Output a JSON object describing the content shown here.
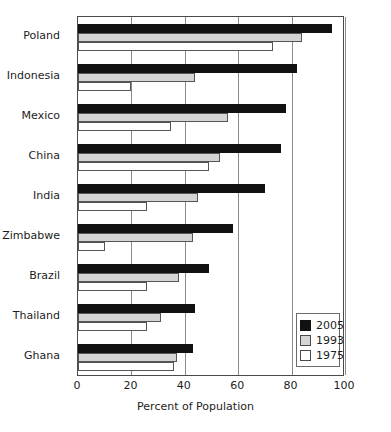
{
  "chart_data": {
    "type": "bar",
    "orientation": "horizontal",
    "title": "",
    "xlabel": "Percent of Population",
    "ylabel": "",
    "xlim": [
      0,
      100
    ],
    "xticks": [
      0,
      20,
      40,
      60,
      80,
      100
    ],
    "grid": true,
    "legend_position": "bottom-right",
    "categories": [
      "Poland",
      "Indonesia",
      "Mexico",
      "China",
      "India",
      "Zimbabwe",
      "Brazil",
      "Thailand",
      "Ghana"
    ],
    "series": [
      {
        "name": "2005",
        "color": "#111111",
        "values": [
          95,
          82,
          78,
          76,
          70,
          58,
          49,
          44,
          43
        ]
      },
      {
        "name": "1993",
        "color": "#d4d4d4",
        "values": [
          84,
          44,
          56,
          53,
          45,
          43,
          38,
          31,
          37
        ]
      },
      {
        "name": "1975",
        "color": "#ffffff",
        "values": [
          73,
          20,
          35,
          49,
          26,
          10,
          26,
          26,
          36
        ]
      }
    ]
  },
  "legend": {
    "items": [
      {
        "label": "2005",
        "swatch": "black-square-swatch"
      },
      {
        "label": "1993",
        "swatch": "grey-square-swatch"
      },
      {
        "label": "1975",
        "swatch": "white-square-swatch"
      }
    ]
  }
}
